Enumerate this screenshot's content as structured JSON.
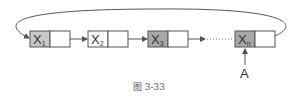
{
  "diagram": {
    "nodes": [
      {
        "label": "X",
        "subscript": "1"
      },
      {
        "label": "X",
        "subscript": "2"
      },
      {
        "label": "X",
        "subscript": "3"
      },
      {
        "label": "X",
        "subscript": "n"
      }
    ],
    "pointer_label": "A",
    "caption": "图 3-33",
    "colors": {
      "data_cell": "#c8c8c8",
      "ptr_cell": "#ffffff",
      "stroke": "#555555"
    }
  }
}
